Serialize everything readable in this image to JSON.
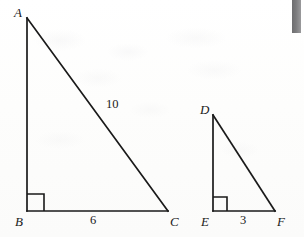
{
  "figure": {
    "background_color": "#fdfdfc",
    "stroke_color": "#1a1a1a",
    "edge_strip": {
      "name": "page-edge-strip",
      "color": "#7c7c7e",
      "x": 292,
      "y": 0,
      "width": 9,
      "height": 33
    }
  },
  "triangles": [
    {
      "id": "ABC",
      "name": "large-triangle-abc",
      "vertices": [
        {
          "label": "A",
          "x": 27,
          "y": 18,
          "label_x": 14,
          "label_y": 6
        },
        {
          "label": "B",
          "x": 27,
          "y": 211,
          "label_x": 15,
          "label_y": 215
        },
        {
          "label": "C",
          "x": 168,
          "y": 211,
          "label_x": 170,
          "label_y": 215
        }
      ],
      "right_angle": {
        "at": "B",
        "name": "right-angle-marker-b",
        "size": 17
      },
      "side_labels": [
        {
          "text": "10",
          "side": "AC",
          "x": 106,
          "y": 98
        },
        {
          "text": "6",
          "side": "BC",
          "x": 90,
          "y": 214
        }
      ]
    },
    {
      "id": "DEF",
      "name": "small-triangle-def",
      "vertices": [
        {
          "label": "D",
          "x": 213,
          "y": 115,
          "label_x": 200,
          "label_y": 103
        },
        {
          "label": "E",
          "x": 213,
          "y": 211,
          "label_x": 201,
          "label_y": 215
        },
        {
          "label": "F",
          "x": 275,
          "y": 211,
          "label_x": 277,
          "label_y": 215
        }
      ],
      "right_angle": {
        "at": "E",
        "name": "right-angle-marker-e",
        "size": 14
      },
      "side_labels": [
        {
          "text": "3",
          "side": "EF",
          "x": 240,
          "y": 214
        }
      ]
    }
  ],
  "labels": {
    "a": "A",
    "b": "B",
    "c": "C",
    "d": "D",
    "e": "E",
    "f": "F",
    "hypotenuse_abc": "10",
    "base_abc": "6",
    "base_def": "3"
  }
}
